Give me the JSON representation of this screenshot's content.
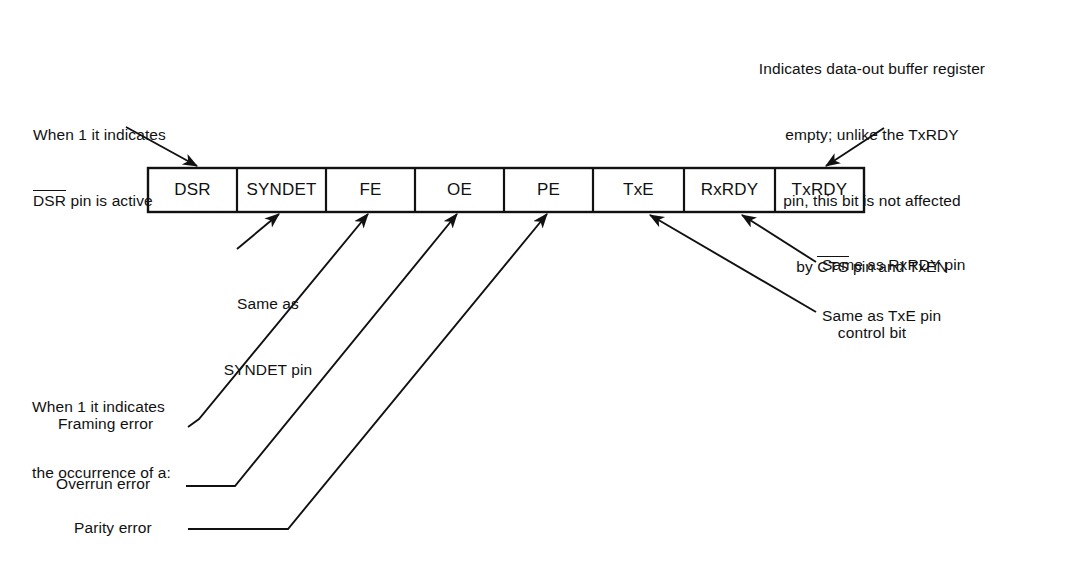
{
  "diagram": {
    "background_color": "#ffffff",
    "line_color": "#111111"
  },
  "register": {
    "name": "status-register",
    "bit_count": 8,
    "cells": [
      {
        "label": "DSR",
        "overline": false
      },
      {
        "label": "SYNDET",
        "overline": false
      },
      {
        "label": "FE",
        "overline": false
      },
      {
        "label": "OE",
        "overline": false
      },
      {
        "label": "PE",
        "overline": false
      },
      {
        "label": "TxE",
        "overline": false
      },
      {
        "label": "RxRDY",
        "overline": false
      },
      {
        "label": "TxRDY",
        "overline": false
      }
    ]
  },
  "annotations": {
    "txrdy": {
      "lines": [
        "Indicates data-out buffer register",
        "empty; unlike the TxRDY",
        "pin, this bit is not affected"
      ],
      "line4_prefix": "by ",
      "line4_overline": "CTS",
      "line4_suffix": " pin and TxEN",
      "line5": "control bit"
    },
    "dsr": {
      "line1": "When 1 it indicates",
      "line2_overline": "DSR",
      "line2_suffix": " pin is active"
    },
    "syndet": {
      "line1": "Same as",
      "line2": "SYNDET pin"
    },
    "occurrence": {
      "line1": "When 1 it indicates",
      "line2": "the occurrence of a:"
    },
    "framing_error": "Framing error",
    "overrun_error": "Overrun error",
    "parity_error": "Parity error",
    "rxrdy": "Same as RxRDY pin",
    "txe": "Same as TxE pin"
  }
}
